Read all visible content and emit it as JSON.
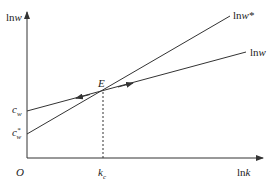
{
  "diagram": {
    "y_axis_label": "lnw",
    "x_axis_label": "lnk",
    "origin_label": "O",
    "point_label": "E",
    "curves": [
      {
        "name": "lnw*",
        "label": "lnw*",
        "intercept_label": "c_w*"
      },
      {
        "name": "lnw",
        "label": "lnw",
        "intercept_label": "c_w"
      }
    ],
    "x_marker_label": "k_c",
    "colors": {
      "line": "#333333",
      "background": "#ffffff"
    }
  },
  "labels": {
    "lnw_prefix": "ln",
    "w": "w",
    "star": "*",
    "lnk_prefix": "ln",
    "k": "k",
    "O": "O",
    "E": "E",
    "c": "c",
    "w_sub": "w",
    "k_main": "k",
    "c_sub": "c"
  }
}
